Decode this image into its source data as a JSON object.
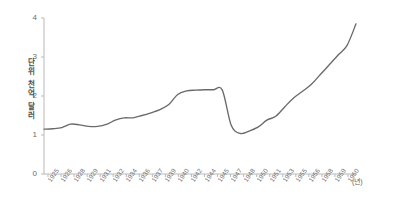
{
  "chart_data": {
    "type": "line",
    "title": "",
    "xlabel": "(년)",
    "ylabel": "단위 천억 달러",
    "ylabel_chars": [
      "단",
      "위",
      "천",
      "억",
      "달",
      "러"
    ],
    "xlim": [
      1925,
      1960
    ],
    "ylim": [
      0,
      4
    ],
    "y_ticks": [
      "0",
      "1",
      "2",
      "3",
      "4"
    ],
    "y_tick_values": [
      0,
      1,
      2,
      3,
      4
    ],
    "grid": false,
    "legend": false,
    "line_color": "#6a6a6a",
    "x_tick_labels": [
      "1925",
      "1926",
      "1928",
      "1929",
      "1931",
      "1932",
      "1934",
      "1936",
      "1937",
      "1939",
      "1940",
      "1942",
      "1944",
      "1945",
      "1947",
      "1948",
      "1950",
      "1951",
      "1953",
      "1955",
      "1956",
      "1958",
      "1959",
      "1960"
    ],
    "x": [
      1925,
      1926,
      1927,
      1928,
      1929,
      1930,
      1931,
      1932,
      1933,
      1934,
      1935,
      1936,
      1937,
      1938,
      1939,
      1940,
      1941,
      1942,
      1943,
      1944,
      1945,
      1946,
      1947,
      1948,
      1949,
      1950,
      1951,
      1952,
      1953,
      1954,
      1955,
      1956,
      1957,
      1958,
      1959,
      1960
    ],
    "values": [
      1.15,
      1.16,
      1.19,
      1.28,
      1.26,
      1.22,
      1.22,
      1.27,
      1.38,
      1.44,
      1.44,
      1.5,
      1.57,
      1.65,
      1.78,
      2.04,
      2.13,
      2.15,
      2.16,
      2.16,
      2.15,
      1.25,
      1.04,
      1.1,
      1.2,
      1.38,
      1.48,
      1.72,
      1.95,
      2.12,
      2.3,
      2.55,
      2.8,
      3.05,
      3.3,
      3.85
    ],
    "series": [
      {
        "name": "",
        "values": [
          1.15,
          1.16,
          1.19,
          1.28,
          1.26,
          1.22,
          1.22,
          1.27,
          1.38,
          1.44,
          1.44,
          1.5,
          1.57,
          1.65,
          1.78,
          2.04,
          2.13,
          2.15,
          2.16,
          2.16,
          2.15,
          1.25,
          1.04,
          1.1,
          1.2,
          1.38,
          1.48,
          1.72,
          1.95,
          2.12,
          2.3,
          2.55,
          2.8,
          3.05,
          3.3,
          3.85
        ]
      }
    ],
    "annotations": []
  }
}
